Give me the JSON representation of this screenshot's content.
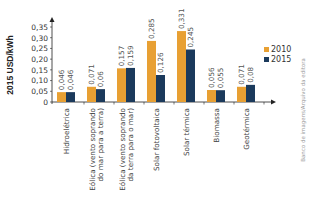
{
  "chart_data": {
    "type": "bar",
    "title": "",
    "xlabel": "",
    "ylabel": "2015 USD/kWh",
    "ylim": [
      0,
      0.35
    ],
    "yticks": [
      "0",
      "0,05",
      "0,10",
      "0,15",
      "0,20",
      "0,25",
      "0,30",
      "0,35"
    ],
    "categories": [
      "Hidroelétrica",
      "Eólica (vento soprando do mar para a terra)",
      "Eólica (vento soprando da terra para o mar)",
      "Solar fotovoltaica",
      "Solar térmica",
      "Biomassa",
      "Geotérmica"
    ],
    "category_lines": [
      [
        "Hidroelétrica"
      ],
      [
        "Eólica (vento soprando",
        "do mar para a terra)"
      ],
      [
        "Eólica (vento soprando",
        "da terra para o mar)"
      ],
      [
        "Solar fotovoltaica"
      ],
      [
        "Solar térmica"
      ],
      [
        "Biomassa"
      ],
      [
        "Geotérmica"
      ]
    ],
    "series": [
      {
        "name": "2010",
        "color": "#e8a033",
        "values": [
          0.046,
          0.071,
          0.157,
          0.285,
          0.331,
          0.056,
          0.071
        ],
        "labels": [
          "0,046",
          "0,071",
          "0,157",
          "0,285",
          "0,331",
          "0,056",
          "0,071"
        ]
      },
      {
        "name": "2015",
        "color": "#1b3a5c",
        "values": [
          0.046,
          0.06,
          0.159,
          0.126,
          0.245,
          0.055,
          0.08
        ],
        "labels": [
          "0,046",
          "0,06",
          "0,159",
          "0,126",
          "0,245",
          "0,055",
          "0,08"
        ]
      }
    ],
    "grid": false,
    "legend_position": "right"
  },
  "credit": "Banco de imagens/Arquivo da editora"
}
